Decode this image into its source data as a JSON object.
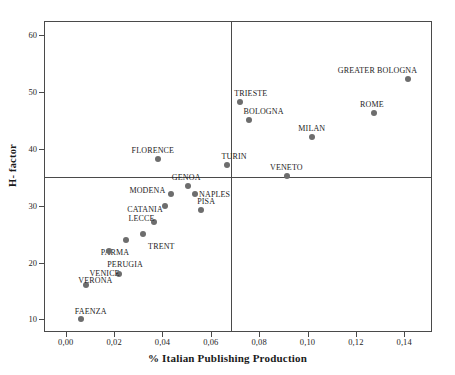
{
  "chart_data": {
    "type": "scatter",
    "title": "",
    "xlabel": "% Italian Publishing Production",
    "ylabel": "H- factor",
    "xlim": [
      -0.009,
      0.1515
    ],
    "ylim": [
      7.8,
      62.5
    ],
    "grid": false,
    "legend": null,
    "xticks": [
      "0,00",
      "0,02",
      "0,04",
      "0,06",
      "0,08",
      "0,10",
      "0,12",
      "0,14"
    ],
    "xtick_values": [
      0.0,
      0.02,
      0.04,
      0.06,
      0.08,
      0.1,
      0.12,
      0.14
    ],
    "yticks": [
      "10",
      "20",
      "30",
      "40",
      "50",
      "60"
    ],
    "ytick_values": [
      10,
      20,
      30,
      40,
      50,
      60
    ],
    "reference_lines": [
      {
        "orientation": "vertical",
        "value": 0.0685
      },
      {
        "orientation": "horizontal",
        "value": 35
      }
    ],
    "marker_color": "#6d6d6d",
    "axis_color": "#4a4a4a",
    "points": [
      {
        "name": "GREATER BOLOGNA",
        "x": 0.1415,
        "y": 52.3,
        "label_dx": -70,
        "label_dy": -13
      },
      {
        "name": "ROME",
        "x": 0.1275,
        "y": 46.4,
        "label_dx": -14,
        "label_dy": -13
      },
      {
        "name": "MILAN",
        "x": 0.102,
        "y": 42.1,
        "label_dx": -14,
        "label_dy": -13
      },
      {
        "name": "TRIESTE",
        "x": 0.0722,
        "y": 48.3,
        "label_dx": -6,
        "label_dy": -13
      },
      {
        "name": "BOLOGNA",
        "x": 0.076,
        "y": 45.1,
        "label_dx": -6,
        "label_dy": -13
      },
      {
        "name": "TURIN",
        "x": 0.0665,
        "y": 37.2,
        "label_dx": -5,
        "label_dy": -13
      },
      {
        "name": "VENETO",
        "x": 0.0915,
        "y": 35.2,
        "label_dx": -17,
        "label_dy": -13
      },
      {
        "name": "FLORENCE",
        "x": 0.038,
        "y": 38.2,
        "label_dx": -26,
        "label_dy": -13
      },
      {
        "name": "GENOA",
        "x": 0.0505,
        "y": 33.4,
        "label_dx": -16,
        "label_dy": -13
      },
      {
        "name": "NAPLES",
        "x": 0.0535,
        "y": 32.0,
        "label_dx": 4,
        "label_dy": -4
      },
      {
        "name": "PISA",
        "x": 0.056,
        "y": 29.2,
        "label_dx": -4,
        "label_dy": -13
      },
      {
        "name": "MODENA",
        "x": 0.0437,
        "y": 32.0,
        "label_dx": -42,
        "label_dy": -8
      },
      {
        "name": "CATANIA",
        "x": 0.0412,
        "y": 30.0,
        "label_dx": -38,
        "label_dy": -1
      },
      {
        "name": "LECCE",
        "x": 0.0363,
        "y": 27.1,
        "label_dx": -25,
        "label_dy": -8
      },
      {
        "name": "TRENT",
        "x": 0.032,
        "y": 25.0,
        "label_dx": 5,
        "label_dy": 8
      },
      {
        "name": "PARMA",
        "x": 0.0248,
        "y": 24.0,
        "label_dx": -25,
        "label_dy": 8
      },
      {
        "name": "PERUGIA",
        "x": 0.018,
        "y": 22.0,
        "label_dx": -2,
        "label_dy": 9
      },
      {
        "name": "VENICE",
        "x": 0.0222,
        "y": 18.0,
        "label_dx": -30,
        "label_dy": -5
      },
      {
        "name": "VERONA",
        "x": 0.0085,
        "y": 16.0,
        "label_dx": -8,
        "label_dy": -9
      },
      {
        "name": "FAENZA",
        "x": 0.0062,
        "y": 10.1,
        "label_dx": -6,
        "label_dy": -12
      }
    ]
  },
  "layout": {
    "plot_left": 44,
    "plot_top": 21,
    "plot_width": 388,
    "plot_height": 311
  }
}
